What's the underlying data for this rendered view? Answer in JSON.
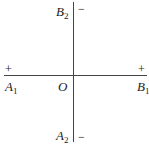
{
  "diagram": {
    "type": "axes-cross",
    "center_label": "O",
    "points": {
      "A1": {
        "letter": "A",
        "sub": "1",
        "sign": "+"
      },
      "B1": {
        "letter": "B",
        "sub": "1",
        "sign": "+"
      },
      "B2": {
        "letter": "B",
        "sub": "2",
        "sign": "−"
      },
      "A2": {
        "letter": "A",
        "sub": "2",
        "sign": "−"
      }
    },
    "line_color": "#444444"
  }
}
